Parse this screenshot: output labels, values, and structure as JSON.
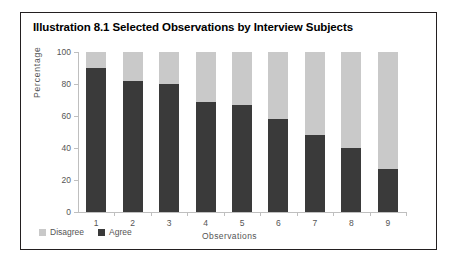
{
  "figure": {
    "title": "Illustration 8.1 Selected Observations by Interview Subjects",
    "border_color": "#231f20"
  },
  "legend": {
    "position": "bottom-left",
    "items": [
      {
        "label": "Disagree",
        "color": "#c9c9c9",
        "swatch_name": "legend-swatch-disagree"
      },
      {
        "label": "Agree",
        "color": "#3a3a3a",
        "swatch_name": "legend-swatch-agree"
      }
    ]
  },
  "chart_data": {
    "type": "bar",
    "stacked": true,
    "title": "Illustration 8.1 Selected Observations by Interview Subjects",
    "xlabel": "Observations",
    "ylabel": "Percentage",
    "categories": [
      "1",
      "2",
      "3",
      "4",
      "5",
      "6",
      "7",
      "8",
      "9"
    ],
    "ylim": [
      0,
      100
    ],
    "yticks": [
      0,
      20,
      40,
      60,
      80,
      100
    ],
    "ytick_labels": [
      "0",
      "20",
      "40",
      "60",
      "80",
      "100"
    ],
    "grid": false,
    "legend_position": "bottom-left",
    "series": [
      {
        "name": "Agree",
        "color": "#3a3a3a",
        "values": [
          90,
          82,
          80,
          69,
          67,
          58,
          48,
          40,
          27
        ]
      },
      {
        "name": "Disagree",
        "color": "#c9c9c9",
        "values": [
          10,
          18,
          20,
          31,
          33,
          42,
          52,
          60,
          73
        ]
      }
    ]
  }
}
